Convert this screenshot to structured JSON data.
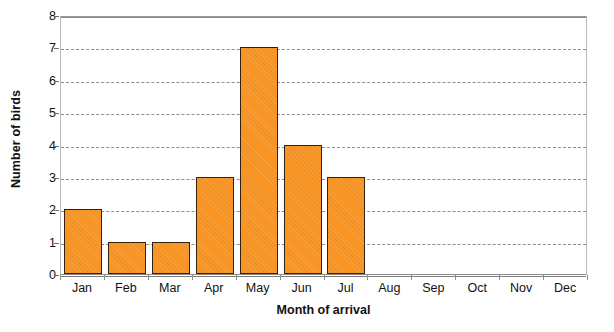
{
  "chart_data": {
    "type": "bar",
    "title": "Number of birds arriving each month",
    "xlabel": "Month of arrival",
    "ylabel": "Number of birds",
    "categories": [
      "Jan",
      "Feb",
      "Mar",
      "Apr",
      "May",
      "Jun",
      "Jul",
      "Aug",
      "Sep",
      "Oct",
      "Nov",
      "Dec"
    ],
    "values": [
      2,
      1,
      1,
      3,
      7,
      4,
      3,
      0,
      0,
      0,
      0,
      0
    ],
    "ylim": [
      0,
      8
    ],
    "ytick_labels": [
      "0",
      "1",
      "2",
      "3",
      "4",
      "5",
      "6",
      "7",
      "8"
    ],
    "ytick_values": [
      0,
      1,
      2,
      3,
      4,
      5,
      6,
      7,
      8
    ],
    "grid": true,
    "grid_axis": "y",
    "legend": false,
    "legend_position": "none",
    "bar_color": "#f59222",
    "bar_border_color": "#33210d",
    "gridline_color": "#8d8d8d",
    "axis_color": "#8a8a8a",
    "plot_background": "#ffffff"
  }
}
